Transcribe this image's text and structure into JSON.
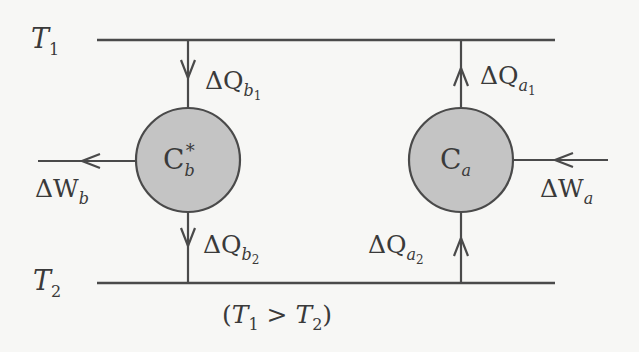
{
  "diagram": {
    "reservoirs": {
      "hot": {
        "symbol": "T",
        "index": "1"
      },
      "cold": {
        "symbol": "T",
        "index": "2"
      }
    },
    "condition": {
      "open": "(",
      "lhs_symbol": "T",
      "lhs_index": "1",
      "op": " > ",
      "rhs_symbol": "T",
      "rhs_index": "2",
      "close": ")"
    },
    "engines": [
      {
        "id": "b",
        "symbol": "C",
        "sub": "b",
        "sup": "*",
        "label": "C_b*"
      },
      {
        "id": "a",
        "symbol": "C",
        "sub": "a",
        "sup": "",
        "label": "C_a"
      }
    ],
    "flows": {
      "dQb1": {
        "delta": "ΔQ",
        "sub": "b",
        "subsub": "1",
        "direction": "down"
      },
      "dQb2": {
        "delta": "ΔQ",
        "sub": "b",
        "subsub": "2",
        "direction": "down"
      },
      "dQa1": {
        "delta": "ΔQ",
        "sub": "a",
        "subsub": "1",
        "direction": "up"
      },
      "dQa2": {
        "delta": "ΔQ",
        "sub": "a",
        "subsub": "2",
        "direction": "up"
      },
      "dWb": {
        "delta": "ΔW",
        "sub": "b",
        "direction": "out-left"
      },
      "dWa": {
        "delta": "ΔW",
        "sub": "a",
        "direction": "in-left"
      }
    },
    "colors": {
      "line": "#4a4a4a",
      "circle_fill": "#c4c4c4",
      "text": "#3a3a3a",
      "background": "#f7f7f5"
    }
  }
}
